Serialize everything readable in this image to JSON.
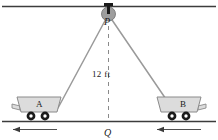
{
  "figure": {
    "labels": {
      "pulley_point": "P",
      "ground_point": "Q",
      "distance": "12 ft",
      "cart_left": "A",
      "cart_right": "B"
    },
    "colors": {
      "ceiling_line": "#3c3c3c",
      "ground_line": "#3c3c3c",
      "cable": "#9a9a9a",
      "cart_body": "#dcdcdc",
      "cart_outline": "#8a8a8a",
      "wheel": "#1a1a1a",
      "pulley_fill": "#9e9e9e",
      "dashed_line": "#8a8a8a",
      "arrow": "#3c3c3c",
      "text": "#1a1a1a"
    },
    "elements": {
      "ceiling_label": "ceiling track line",
      "ground_label": "ground line",
      "pulley_label": "pulley hanging from ceiling",
      "bracket_label": "pulley mounting bracket",
      "cable_left_label": "cable from pulley to cart A",
      "cable_right_label": "cable from pulley to cart B",
      "dashed_label": "vertical distance PQ",
      "arrow_left_label": "left motion arrow",
      "arrow_right_label": "right motion arrow"
    },
    "geometry": {
      "pulley_x": 108,
      "pulley_y": 14,
      "ground_y": 121,
      "ceiling_y": 6,
      "cart_a_x": 46,
      "cart_b_x": 190,
      "distance_value": 12,
      "distance_unit": "ft"
    }
  }
}
